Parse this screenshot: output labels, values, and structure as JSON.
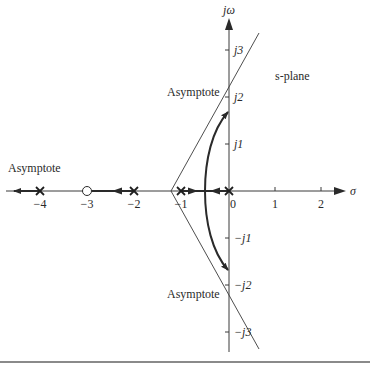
{
  "diagram": {
    "type": "root-locus",
    "plane_label": "s-plane",
    "axes": {
      "real_axis_label": "σ",
      "imag_axis_label": "jω",
      "real_ticks": [
        "−4",
        "−3",
        "−2",
        "−1",
        "0",
        "1",
        "2"
      ],
      "imag_ticks": [
        "j3",
        "j2",
        "j1",
        "−j1",
        "−j2",
        "−j3"
      ]
    },
    "asymptote_labels": {
      "left": "Asymptote",
      "upper": "Asymptote",
      "lower": "Asymptote"
    },
    "poles": [
      0,
      -1,
      -2,
      -4
    ],
    "zeros": [
      -3
    ],
    "asymptote_centroid": -1.33,
    "asymptote_angles_deg": [
      60,
      180,
      -60
    ],
    "breakaway_point": -0.55,
    "colors": {
      "line": "#2a2a2a",
      "axis": "#3a3a3a",
      "rule": "#8a8a8a"
    }
  }
}
